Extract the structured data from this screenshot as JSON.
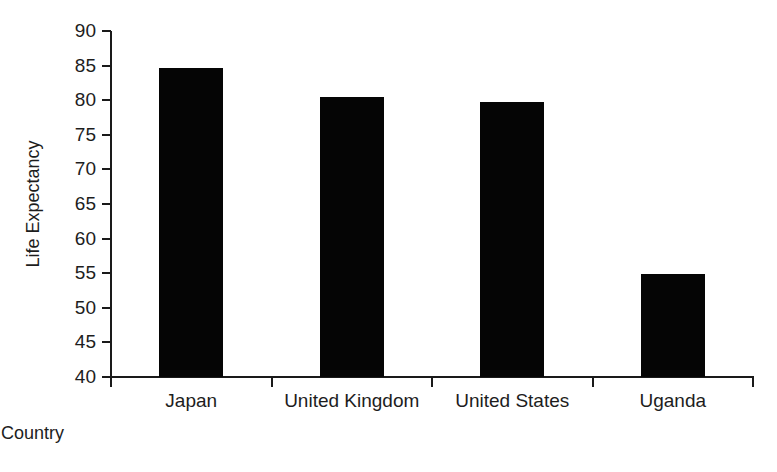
{
  "chart_data": {
    "type": "bar",
    "title": "",
    "subtitle": "",
    "xlabel": "Country",
    "ylabel": "Life Expectancy",
    "categories": [
      "Japan",
      "United Kingdom",
      "United States",
      "Uganda"
    ],
    "values": [
      84.6,
      80.5,
      79.7,
      54.9
    ],
    "series": [
      {
        "name": "Life Expectancy",
        "values": [
          84.6,
          80.5,
          79.7,
          54.9
        ]
      }
    ],
    "ylim": [
      40,
      90
    ],
    "ytick_labels": [
      "40",
      "45",
      "50",
      "55",
      "60",
      "65",
      "70",
      "75",
      "80",
      "85",
      "90"
    ],
    "ytick_values": [
      40,
      45,
      50,
      55,
      60,
      65,
      70,
      75,
      80,
      85,
      90
    ],
    "ytick_step": 5,
    "grid": false,
    "legend": false,
    "legend_position": "none",
    "bar_color": "#050505",
    "axis_color": "#1a1a1a",
    "text_color": "#1d1d1d",
    "background_color": "#ffffff",
    "annotations": []
  }
}
